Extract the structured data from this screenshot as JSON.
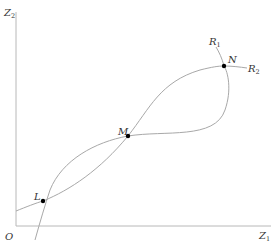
{
  "diagram": {
    "axes": {
      "y_label": {
        "base": "Z",
        "sub": "2"
      },
      "x_label": {
        "base": "Z",
        "sub": "1"
      },
      "origin_label": "O"
    },
    "curves": [
      {
        "name": "R1",
        "label": {
          "base": "R",
          "sub": "1"
        }
      },
      {
        "name": "R2",
        "label": {
          "base": "R",
          "sub": "2"
        }
      }
    ],
    "points": [
      {
        "name": "L",
        "label": "L"
      },
      {
        "name": "M",
        "label": "M"
      },
      {
        "name": "N",
        "label": "N"
      }
    ],
    "colors": {
      "axis": "#b8b8b8",
      "curve": "#a8a8a8",
      "point": "#000000",
      "text": "#333333"
    }
  }
}
